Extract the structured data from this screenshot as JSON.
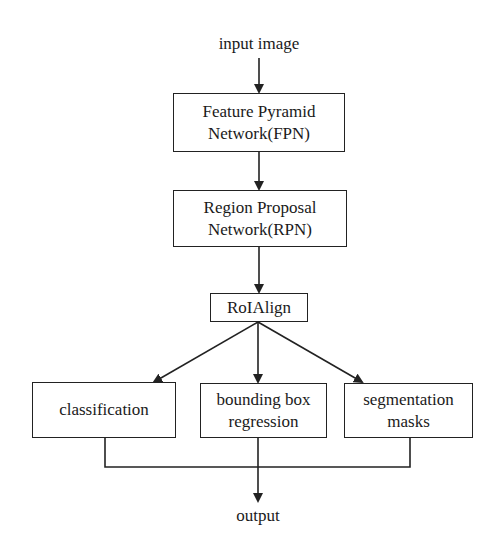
{
  "diagram": {
    "input_label": "input image",
    "output_label": "output",
    "nodes": {
      "fpn": {
        "line1": "Feature Pyramid",
        "line2": "Network(FPN)"
      },
      "rpn": {
        "line1": "Region Proposal",
        "line2": "Network(RPN)"
      },
      "roialign": {
        "label": "RoIAlign"
      },
      "classification": {
        "label": "classification"
      },
      "bbox": {
        "line1": "bounding box",
        "line2": "regression"
      },
      "masks": {
        "line1": "segmentation",
        "line2": "masks"
      }
    },
    "edges": [
      {
        "from": "input image",
        "to": "fpn"
      },
      {
        "from": "fpn",
        "to": "rpn"
      },
      {
        "from": "rpn",
        "to": "roialign"
      },
      {
        "from": "roialign",
        "to": "classification"
      },
      {
        "from": "roialign",
        "to": "bbox"
      },
      {
        "from": "roialign",
        "to": "masks"
      },
      {
        "from": "classification",
        "to": "output"
      },
      {
        "from": "bbox",
        "to": "output"
      },
      {
        "from": "masks",
        "to": "output"
      }
    ],
    "colors": {
      "stroke": "#222222",
      "background": "#ffffff",
      "text": "#1a1a1a"
    }
  }
}
